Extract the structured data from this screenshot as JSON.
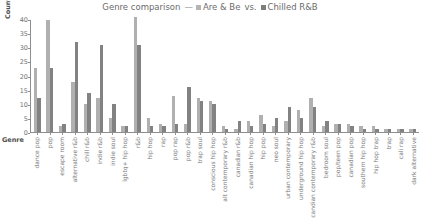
{
  "legend": {
    "title_prefix": "Genre comparison",
    "dash": "—",
    "series_a": "Are & Be",
    "vs": "vs.",
    "series_b": "Chilled R&B",
    "color_a": "#b0b0b0",
    "color_b": "#828282"
  },
  "axis": {
    "ylabel": "Count",
    "xlabel": "Genre",
    "yticks": [
      0,
      5,
      10,
      15,
      20,
      25,
      30,
      35,
      40
    ]
  },
  "chart_data": {
    "type": "bar",
    "title": "Genre comparison — Are & Be vs. Chilled R&B",
    "xlabel": "Genre",
    "ylabel": "Count",
    "ylim": [
      0,
      40
    ],
    "grid": false,
    "legend_position": "top-center",
    "categories": [
      "dance pop",
      "pop",
      "escape room",
      "alternative r&b",
      "chill r&b",
      "indie r&b",
      "indie soul",
      "lgbtq+ hip hop",
      "r&b",
      "hip hop",
      "rap",
      "pop rap",
      "pop r&b",
      "trap soul",
      "conscious hip hop",
      "alt contemporary r&b",
      "canadian r&b",
      "canadian hip hop",
      "hip pop",
      "neo soul",
      "urban contemporary",
      "underground hip hop",
      "candian contemporary r&b",
      "bedroom soul",
      "pop/teen pop",
      "canadian pop",
      "southern hip hop",
      "hip hop trap",
      "trap",
      "cali rap",
      "dark alternative"
    ],
    "series": [
      {
        "name": "Are & Be",
        "color": "#b0b0b0",
        "values": [
          23,
          40,
          2,
          18,
          10,
          12,
          5,
          2,
          41,
          5,
          3,
          13,
          3,
          12,
          11,
          2,
          1,
          4,
          6,
          2,
          4,
          8,
          12,
          2,
          3,
          3,
          2,
          2,
          1,
          1,
          1
        ]
      },
      {
        "name": "Chilled R&B",
        "color": "#828282",
        "values": [
          12,
          23,
          3,
          32,
          14,
          31,
          10,
          2,
          31,
          2,
          2,
          3,
          16,
          11,
          10,
          1,
          4,
          2,
          3,
          5,
          9,
          5,
          9,
          4,
          3,
          2,
          1,
          1,
          1,
          1,
          1
        ]
      }
    ]
  }
}
